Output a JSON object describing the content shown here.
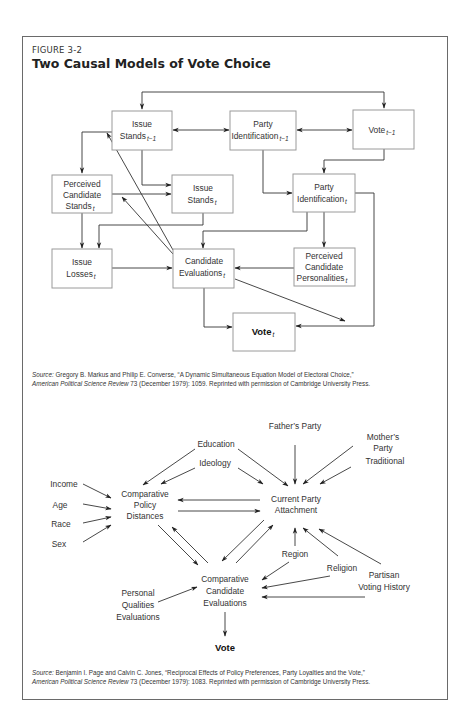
{
  "figure": {
    "label": "FIGURE 3-2",
    "title": "Two Causal Models of Vote Choice"
  },
  "model1": {
    "nodes": {
      "issue_stands_prev": {
        "line1": "Issue",
        "line2": "Stands",
        "sub": "t−1"
      },
      "party_id_prev": {
        "line1": "Party",
        "line2": "Identification",
        "sub": "t−1"
      },
      "vote_prev": {
        "line1": "Vote",
        "sub": "t−1"
      },
      "perceived_cand_stands": {
        "line1": "Perceived",
        "line2": "Candidate",
        "line3": "Stands",
        "sub": "t"
      },
      "issue_stands": {
        "line1": "Issue",
        "line2": "Stands",
        "sub": "t"
      },
      "party_id": {
        "line1": "Party",
        "line2": "Identification",
        "sub": "t"
      },
      "issue_losses": {
        "line1": "Issue",
        "line2": "Losses",
        "sub": "t"
      },
      "cand_evals": {
        "line1": "Candidate",
        "line2": "Evaluations",
        "sub": "t"
      },
      "perceived_cand_pers": {
        "line1": "Perceived",
        "line2": "Candidate",
        "line3": "Personalities",
        "sub": "t"
      },
      "vote": {
        "line1": "Vote",
        "sub": "t"
      }
    },
    "source": {
      "label": "Source:",
      "text1": " Gregory B. Markus and Philip E. Converse, “A Dynamic Simultaneous Equation Model of Electoral Choice,”",
      "journal": "American Political Science Review",
      "text2": " 73 (December 1979): 1059. Reprinted with permission of Cambridge University Press."
    }
  },
  "model2": {
    "nodes": {
      "income": "Income",
      "age": "Age",
      "race": "Race",
      "sex": "Sex",
      "education": "Education",
      "ideology": "Ideology",
      "fathers_party": "Father’s Party",
      "mothers_party_1": "Mother’s",
      "mothers_party_2": "Party",
      "traditional": "Traditional",
      "policy_dist_1": "Comparative",
      "policy_dist_2": "Policy",
      "policy_dist_3": "Distances",
      "party_attach_1": "Current Party",
      "party_attach_2": "Attachment",
      "region": "Region",
      "religion": "Religion",
      "partisan_1": "Partisan",
      "partisan_2": "Voting History",
      "personal_1": "Personal",
      "personal_2": "Qualities",
      "personal_3": "Evaluations",
      "cand_eval_1": "Comparative",
      "cand_eval_2": "Candidate",
      "cand_eval_3": "Evaluations",
      "vote": "Vote"
    },
    "source": {
      "label": "Source:",
      "text1": " Benjamin I. Page and Calvin C. Jones, “Reciprocal Effects of Policy Preferences, Party Loyalties and the Vote,”",
      "journal": "American Political Science Review",
      "text2": " 73 (December 1979): 1083. Reprinted with permission of Cambridge University Press."
    }
  }
}
